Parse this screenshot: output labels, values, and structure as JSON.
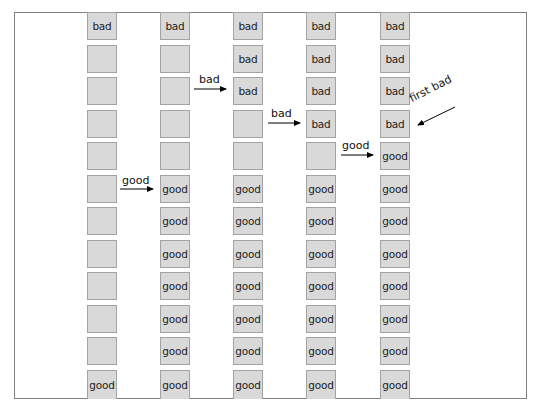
{
  "diagram": {
    "columns": [
      {
        "id": "step-1",
        "cells": [
          "bad",
          "",
          "",
          "",
          "",
          "",
          "",
          "",
          "",
          "",
          "",
          "good"
        ]
      },
      {
        "id": "step-2",
        "cells": [
          "bad",
          "",
          "",
          "",
          "",
          "good",
          "good",
          "good",
          "good",
          "good",
          "good",
          "good"
        ]
      },
      {
        "id": "step-3",
        "cells": [
          "bad",
          "bad",
          "bad",
          "",
          "",
          "good",
          "good",
          "good",
          "good",
          "good",
          "good",
          "good"
        ]
      },
      {
        "id": "step-4",
        "cells": [
          "bad",
          "bad",
          "bad",
          "bad",
          "",
          "good",
          "good",
          "good",
          "good",
          "good",
          "good",
          "good"
        ]
      },
      {
        "id": "step-5",
        "cells": [
          "bad",
          "bad",
          "bad",
          "bad",
          "good",
          "good",
          "good",
          "good",
          "good",
          "good",
          "good",
          "good"
        ]
      }
    ],
    "arrows": [
      {
        "label": "good",
        "from_column": 1,
        "to_column": 2,
        "row": 5
      },
      {
        "label": "bad",
        "from_column": 2,
        "to_column": 3,
        "row": 2
      },
      {
        "label": "bad",
        "from_column": 3,
        "to_column": 4,
        "row": 3
      },
      {
        "label": "good",
        "from_column": 4,
        "to_column": 5,
        "row": 4
      }
    ],
    "annotation": {
      "label": "first bad",
      "points_to": {
        "column": 5,
        "row": 3
      }
    },
    "colors": {
      "box_fill": "#d9d9d9",
      "box_border": "#a3a3a3",
      "frame": "#7f7f7f",
      "arrow": "#000000"
    }
  }
}
